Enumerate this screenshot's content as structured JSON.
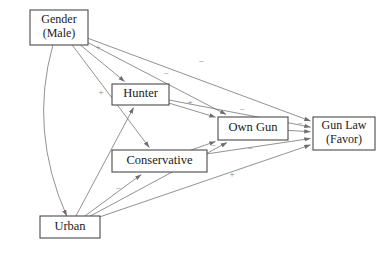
{
  "diagram": {
    "type": "path-diagram",
    "title": "",
    "nodes": [
      {
        "id": "gender",
        "lines": [
          "Gender",
          "(Male)"
        ],
        "x": 30,
        "y": 10,
        "w": 58,
        "h": 35
      },
      {
        "id": "hunter",
        "lines": [
          "Hunter"
        ],
        "x": 112,
        "y": 84,
        "w": 57,
        "h": 21
      },
      {
        "id": "conservative",
        "lines": [
          "Conservative"
        ],
        "x": 112,
        "y": 150,
        "w": 95,
        "h": 22
      },
      {
        "id": "urban",
        "lines": [
          "Urban"
        ],
        "x": 40,
        "y": 216,
        "w": 60,
        "h": 22
      },
      {
        "id": "owngun",
        "lines": [
          "Own Gun"
        ],
        "x": 218,
        "y": 117,
        "w": 70,
        "h": 23
      },
      {
        "id": "gunlaw",
        "lines": [
          "Gun Law",
          "(Favor)"
        ],
        "x": 313,
        "y": 117,
        "w": 62,
        "h": 33
      }
    ],
    "edges": [
      {
        "id": "gender-hunter",
        "from": "gender",
        "to": "hunter",
        "sign": "+",
        "sign_x": 98,
        "sign_y": 48
      },
      {
        "id": "gender-conservative",
        "from": "gender",
        "to": "conservative",
        "sign": "+",
        "sign_x": 101,
        "sign_y": 93
      },
      {
        "id": "gender-owngun",
        "from": "gender",
        "to": "owngun",
        "sign": "−",
        "sign_x": 166,
        "sign_y": 74
      },
      {
        "id": "gender-gunlaw",
        "from": "gender",
        "to": "gunlaw",
        "sign": "−",
        "sign_x": 201,
        "sign_y": 62
      },
      {
        "id": "gender-urban",
        "from": "gender",
        "to": "urban",
        "sign": "",
        "sign_x": 0,
        "sign_y": 0,
        "curved": true
      },
      {
        "id": "hunter-owngun",
        "from": "hunter",
        "to": "owngun",
        "sign": "+",
        "sign_x": 190,
        "sign_y": 103
      },
      {
        "id": "hunter-gunlaw",
        "from": "hunter",
        "to": "gunlaw",
        "sign": "−",
        "sign_x": 242,
        "sign_y": 110
      },
      {
        "id": "conservative-owngun",
        "from": "conservative",
        "to": "owngun",
        "sign": "−",
        "sign_x": 213,
        "sign_y": 146
      },
      {
        "id": "conservative-gunlaw",
        "from": "conservative",
        "to": "gunlaw",
        "sign": "−",
        "sign_x": 250,
        "sign_y": 149
      },
      {
        "id": "urban-hunter",
        "from": "urban",
        "to": "hunter",
        "sign": "",
        "sign_x": 0,
        "sign_y": 0
      },
      {
        "id": "urban-conservative",
        "from": "urban",
        "to": "conservative",
        "sign": "−",
        "sign_x": 118,
        "sign_y": 189
      },
      {
        "id": "urban-owngun",
        "from": "urban",
        "to": "owngun",
        "sign": "+",
        "sign_x": 232,
        "sign_y": 175
      },
      {
        "id": "urban-gunlaw",
        "from": "urban",
        "to": "gunlaw",
        "sign": "",
        "sign_x": 0,
        "sign_y": 0
      },
      {
        "id": "owngun-gunlaw",
        "from": "owngun",
        "to": "gunlaw",
        "sign": "−",
        "sign_x": 300,
        "sign_y": 124
      }
    ],
    "colors": {
      "node_stroke": "#4a4a4a",
      "node_fill": "#ffffff",
      "edge_stroke": "#6e6e6e",
      "text": "#1a1a1a",
      "sign_text": "#7d7d7d",
      "background": "#ffffff"
    }
  }
}
